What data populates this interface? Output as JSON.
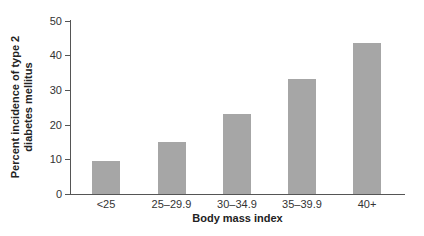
{
  "chart_data": {
    "type": "bar",
    "title": "",
    "xlabel": "Body mass index",
    "ylabel": "Percent incidence of type 2 diabetes mellitus",
    "ylabel_lines": [
      "Percent incidence of type 2",
      "diabetes mellitus"
    ],
    "categories": [
      "<25",
      "25–29.9",
      "30–34.9",
      "35–39.9",
      "40+"
    ],
    "values": [
      9.6,
      15.0,
      23.0,
      33.2,
      43.4
    ],
    "ylim": [
      0,
      50
    ],
    "yticks": [
      0,
      10,
      20,
      30,
      40,
      50
    ],
    "grid": false,
    "legend": null,
    "bar_color": "#a6a6a6"
  }
}
